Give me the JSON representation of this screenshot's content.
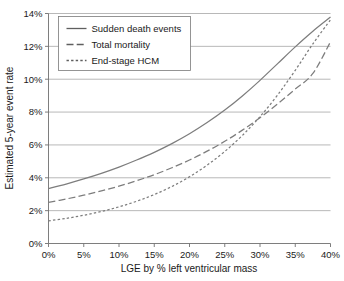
{
  "chart_data": {
    "type": "line",
    "title": "",
    "xlabel": "LGE by % left ventricular mass",
    "ylabel": "Estimated 5-year event rate",
    "xlim": [
      0,
      40
    ],
    "ylim": [
      0,
      14
    ],
    "grid": true,
    "legend_position": "top-left",
    "x_tick_labels": [
      "0%",
      "5%",
      "10%",
      "15%",
      "20%",
      "25%",
      "30%",
      "35%",
      "40%"
    ],
    "x_ticks": [
      0,
      5,
      10,
      15,
      20,
      25,
      30,
      35,
      40
    ],
    "y_tick_labels": [
      "0%",
      "2%",
      "4%",
      "6%",
      "8%",
      "10%",
      "12%",
      "14%"
    ],
    "y_ticks": [
      0,
      2,
      4,
      6,
      8,
      10,
      12,
      14
    ],
    "x": [
      0,
      2.5,
      5,
      7.5,
      10,
      12.5,
      15,
      17.5,
      20,
      22.5,
      25,
      27.5,
      30,
      32.5,
      35,
      37.5,
      40
    ],
    "series": [
      {
        "name": "Sudden death events",
        "style": "solid",
        "color": "#7d7d7d",
        "values": [
          3.35,
          3.62,
          3.93,
          4.27,
          4.65,
          5.08,
          5.55,
          6.08,
          6.68,
          7.36,
          8.12,
          8.98,
          9.93,
          10.95,
          11.97,
          12.92,
          13.78
        ]
      },
      {
        "name": "Total mortality",
        "style": "dashed",
        "color": "#7d7d7d",
        "values": [
          2.5,
          2.71,
          2.94,
          3.2,
          3.49,
          3.82,
          4.19,
          4.61,
          5.08,
          5.62,
          6.22,
          6.9,
          7.66,
          8.5,
          9.4,
          10.35,
          12.28
        ]
      },
      {
        "name": "End-stage HCM",
        "style": "dotted",
        "color": "#7d7d7d",
        "values": [
          1.38,
          1.53,
          1.72,
          1.95,
          2.23,
          2.57,
          2.98,
          3.47,
          4.06,
          4.77,
          5.6,
          6.58,
          7.72,
          9.04,
          10.54,
          12.15,
          13.62
        ]
      }
    ]
  },
  "legend": {
    "items": [
      {
        "label": "Sudden death events",
        "style": "solid"
      },
      {
        "label": "Total mortality",
        "style": "dashed"
      },
      {
        "label": "End-stage HCM",
        "style": "dotted"
      }
    ]
  },
  "axes": {
    "x_title": "LGE by % left ventricular mass",
    "y_title": "Estimated 5-year event rate"
  }
}
